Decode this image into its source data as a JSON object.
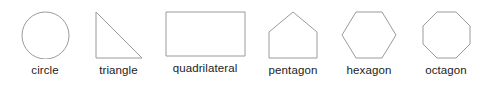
{
  "figure": {
    "background_color": "#ffffff",
    "stroke_color": "#9a9a9a",
    "label_color": "#1b1b1b",
    "shapes": [
      {
        "name": "circle",
        "label": "circle",
        "sides": 0,
        "icon": "circle-outline-icon"
      },
      {
        "name": "triangle",
        "label": "triangle",
        "sides": 3,
        "icon": "right-triangle-outline-icon"
      },
      {
        "name": "quadrilateral",
        "label": "quadrilateral",
        "sides": 4,
        "icon": "rectangle-outline-icon"
      },
      {
        "name": "pentagon",
        "label": "pentagon",
        "sides": 5,
        "icon": "pentagon-outline-icon"
      },
      {
        "name": "hexagon",
        "label": "hexagon",
        "sides": 6,
        "icon": "hexagon-outline-icon"
      },
      {
        "name": "octagon",
        "label": "octagon",
        "sides": 8,
        "icon": "octagon-outline-icon"
      }
    ]
  }
}
